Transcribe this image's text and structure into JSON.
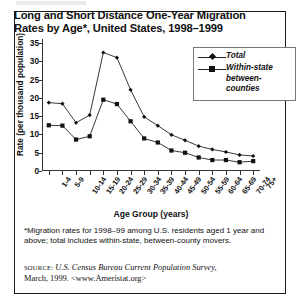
{
  "figure": {
    "title": "Long and Short Distance One-Year Migration Rates by Age*, United States, 1998–1999",
    "footnote": "*Migration rates for 1998–99 among U.S. residents aged 1 year and above; total includes within-state, between-county movers.",
    "source_label": "SOURCE:",
    "source_text": "U.S. Census Bureau Current Population Survey,",
    "source_line2": "March, 1999. <www.Ameristat.org>"
  },
  "chart_data": {
    "type": "line",
    "title": "Long and Short Distance One-Year Migration Rates by Age*, United States, 1998–1999",
    "xlabel": "Age Group (years)",
    "ylabel": "Rate (per thousand population)",
    "ylim": [
      0,
      35
    ],
    "yticks": [
      0,
      5,
      10,
      15,
      20,
      25,
      30,
      35
    ],
    "grid": false,
    "legend_position": "top-right",
    "categories": [
      "1-4",
      "5-9",
      "10-14",
      "15-19",
      "20-24",
      "25-29",
      "30-34",
      "35-39",
      "40-44",
      "45-49",
      "50-54",
      "55-59",
      "60-64",
      "65-69",
      "70-74",
      "75+"
    ],
    "series": [
      {
        "name": "Total",
        "marker": "diamond",
        "values": [
          18.7,
          18.4,
          13.2,
          15.3,
          32.4,
          31.0,
          22.2,
          14.8,
          12.4,
          9.9,
          8.4,
          6.8,
          5.9,
          5.2,
          4.4,
          4.1
        ]
      },
      {
        "name": "Within-state between-counties",
        "marker": "square",
        "values": [
          12.5,
          12.4,
          8.6,
          9.5,
          19.5,
          18.3,
          13.6,
          8.9,
          7.8,
          5.6,
          5.0,
          3.7,
          3.0,
          3.0,
          2.4,
          2.7
        ]
      }
    ]
  },
  "legend": {
    "items": [
      {
        "label": "Total",
        "marker": "diamond"
      },
      {
        "label": "Within-state",
        "label2": "between-counties",
        "marker": "square"
      }
    ]
  },
  "colors": {
    "line": "#222222",
    "marker": "#111111",
    "frame": "#1a1a1a",
    "axis": "#333333"
  }
}
